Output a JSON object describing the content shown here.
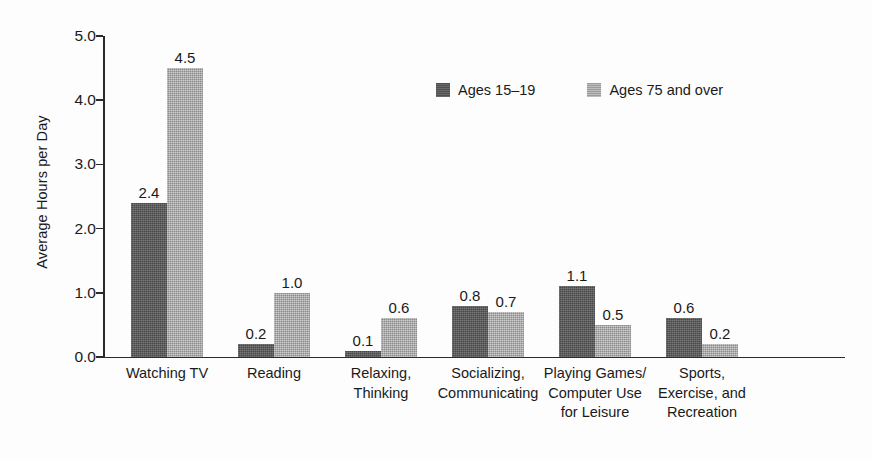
{
  "chart_data": {
    "type": "bar",
    "title": "",
    "subtitle": "",
    "xlabel": "",
    "ylabel": "Average Hours per Day",
    "ylim": [
      0.0,
      5.0
    ],
    "y_ticks": [
      "0.0",
      "1.0",
      "2.0",
      "3.0",
      "4.0",
      "5.0"
    ],
    "y_tick_values": [
      0.0,
      1.0,
      2.0,
      3.0,
      4.0,
      5.0
    ],
    "grid": false,
    "legend_position": "top-center",
    "categories": [
      "Watching TV",
      "Reading",
      "Relaxing,\nThinking",
      "Socializing,\nCommunicating",
      "Playing Games/\nComputer Use\nfor Leisure",
      "Sports,\nExercise, and\nRecreation"
    ],
    "series": [
      {
        "name": "Ages 15–19",
        "color": "#595959",
        "values": [
          2.4,
          0.2,
          0.1,
          0.8,
          1.1,
          0.6
        ],
        "labels": [
          "2.4",
          "0.2",
          "0.1",
          "0.8",
          "1.1",
          "0.6"
        ]
      },
      {
        "name": "Ages 75 and over",
        "color": "#acacac",
        "values": [
          4.5,
          1.0,
          0.6,
          0.7,
          0.5,
          0.2
        ],
        "labels": [
          "4.5",
          "1.0",
          "0.6",
          "0.7",
          "0.5",
          "0.2"
        ]
      }
    ]
  },
  "legend": {
    "entries": [
      {
        "label": "Ages 15–19",
        "swatch": "series-a"
      },
      {
        "label": "Ages 75 and over",
        "swatch": "series-b"
      }
    ]
  },
  "colors": {
    "series_a": "#595959",
    "series_b": "#acacac",
    "axis": "#2b2b2b",
    "text": "#1a1a1a",
    "background": "#fdfdfd"
  }
}
